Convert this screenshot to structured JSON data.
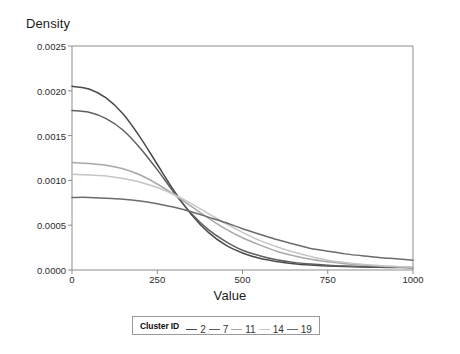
{
  "chart_data": {
    "type": "line",
    "title": "",
    "xlabel": "Value",
    "ylabel": "Density",
    "xlim": [
      0,
      1000
    ],
    "ylim": [
      0,
      0.0025
    ],
    "grid": false,
    "legend_position": "bottom",
    "legend_title": "Cluster ID",
    "xticks": [
      0,
      250,
      500,
      750,
      1000
    ],
    "xtick_labels": [
      "0",
      "250",
      "500",
      "750",
      "1000"
    ],
    "yticks": [
      0.0,
      0.0005,
      0.001,
      0.0015,
      0.002,
      0.0025
    ],
    "ytick_labels": [
      "0.0000",
      "0.0005",
      "0.0010",
      "0.0015",
      "0.0020",
      "0.0025"
    ],
    "x": [
      0,
      50,
      100,
      150,
      200,
      250,
      300,
      350,
      400,
      450,
      500,
      550,
      600,
      650,
      700,
      750,
      800,
      850,
      900,
      950,
      1000
    ],
    "series": [
      {
        "name": "2",
        "color": "#4a4a4a",
        "values": [
          0.00205,
          0.00202,
          0.00192,
          0.00174,
          0.00148,
          0.00118,
          0.00088,
          0.00062,
          0.00042,
          0.00028,
          0.00019,
          0.00013,
          9.5e-05,
          7e-05,
          5.5e-05,
          4.5e-05,
          3.8e-05,
          3.3e-05,
          3e-05,
          2.8e-05,
          2.6e-05
        ]
      },
      {
        "name": "7",
        "color": "#5e5e5e",
        "values": [
          0.00178,
          0.00176,
          0.00169,
          0.00156,
          0.00136,
          0.00112,
          0.00086,
          0.00063,
          0.00045,
          0.00032,
          0.00022,
          0.00016,
          0.000115,
          8.5e-05,
          6.6e-05,
          5.3e-05,
          4.4e-05,
          3.8e-05,
          3.4e-05,
          3.1e-05,
          2.9e-05
        ]
      },
      {
        "name": "11",
        "color": "#a8a8a8",
        "values": [
          0.0012,
          0.00119,
          0.00117,
          0.00113,
          0.00106,
          0.00096,
          0.00084,
          0.00071,
          0.00058,
          0.00046,
          0.00036,
          0.00028,
          0.00021,
          0.00016,
          0.00012,
          9.2e-05,
          7e-05,
          5.5e-05,
          4.4e-05,
          3.6e-05,
          3e-05
        ]
      },
      {
        "name": "14",
        "color": "#c6c6c6",
        "values": [
          0.00107,
          0.00106,
          0.00105,
          0.00102,
          0.00098,
          0.00092,
          0.00084,
          0.00074,
          0.00063,
          0.00052,
          0.00042,
          0.00033,
          0.00026,
          0.0002,
          0.00015,
          0.00011,
          8.5e-05,
          6.5e-05,
          5e-05,
          4e-05,
          3.2e-05
        ]
      },
      {
        "name": "19",
        "color": "#6b6b6b",
        "values": [
          0.00081,
          0.00081,
          0.0008,
          0.00079,
          0.00077,
          0.00074,
          0.0007,
          0.00065,
          0.00059,
          0.00053,
          0.00046,
          0.0004,
          0.00034,
          0.00029,
          0.00024,
          0.00021,
          0.00018,
          0.00016,
          0.00014,
          0.000125,
          0.00011
        ]
      }
    ]
  }
}
